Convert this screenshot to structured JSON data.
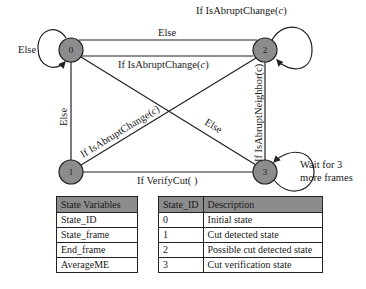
{
  "diagram": {
    "type": "state-machine",
    "node_fill": "#8c8c8c",
    "nodes": [
      {
        "id": "0",
        "label": "0"
      },
      {
        "id": "1",
        "label": "1"
      },
      {
        "id": "2",
        "label": "2"
      },
      {
        "id": "3",
        "label": "3"
      }
    ],
    "edges": {
      "self_0": "Else",
      "e_0_2_top": "Else",
      "e_2_2_top": "If IsAbruptChange(",
      "e_0_2_bottom": "If IsAbruptChange(",
      "e_0_1": "Else",
      "e_1_2": "If IsAbruptChange(",
      "e_0_3": "Else",
      "e_2_3": "If IsAbruptNeighbor(c)",
      "e_1_3": "If VerifyCut( )",
      "self_3_line1": "Wait for 3",
      "self_3_line2": "more frames",
      "italic_c": "c",
      "close_paren": ")"
    }
  },
  "state_variables_table": {
    "header": "State Variables",
    "rows": [
      "State_ID",
      "State_frame",
      "End_frame",
      "AverageME"
    ]
  },
  "state_table": {
    "headers": [
      "State_ID",
      "Description"
    ],
    "rows": [
      [
        "0",
        "Initial state"
      ],
      [
        "1",
        "Cut detected state"
      ],
      [
        "2",
        "Possible cut detected state"
      ],
      [
        "3",
        "Cut verification state"
      ]
    ]
  }
}
